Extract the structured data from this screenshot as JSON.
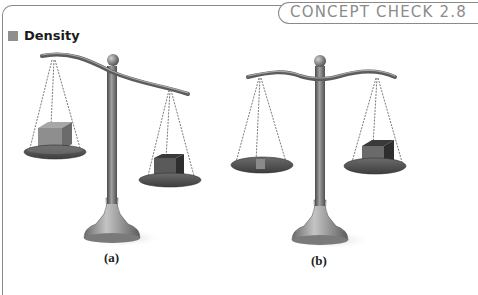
{
  "header": {
    "tab_label": "CONCEPT CHECK 2.8"
  },
  "section": {
    "title": "Density"
  },
  "figures": [
    {
      "caption": "(a)",
      "description": "Balance tipped: left pan (low) holds a large light cube; right pan (higher) holds a smaller dark cube",
      "left_pan_object": "large-light-cube",
      "right_pan_object": "small-dark-cube",
      "tilt": "left-pan-lower"
    },
    {
      "caption": "(b)",
      "description": "Balance level: left pan holds a small flat light block; right pan holds a larger dark cube",
      "left_pan_object": "small-light-block",
      "right_pan_object": "dark-cube",
      "tilt": "level"
    }
  ],
  "colors": {
    "frame_border": "#8a8a8a",
    "tab_text": "#8c8c8c",
    "heading_square": "#8f8f8f",
    "metal_dark": "#5a5a5a",
    "metal_light": "#9a9a9a"
  }
}
